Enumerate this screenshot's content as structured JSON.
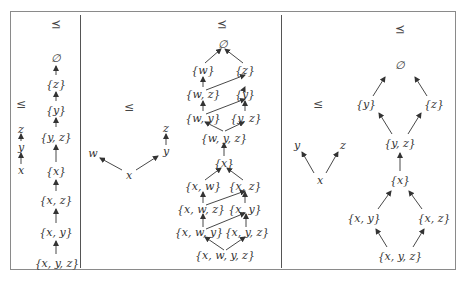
{
  "figure": {
    "panels": [
      {
        "id": "panel-1",
        "order_label": "≤",
        "preorder_label": "⪯",
        "poset_nodes": [
          "z",
          "y",
          "x"
        ],
        "hasse_nodes": [
          "∅",
          "{z}",
          "{y}",
          "{y, z}",
          "{x}",
          "{x, z}",
          "{x, y}",
          "{x, y, z}"
        ]
      },
      {
        "id": "panel-2",
        "order_label": "≤",
        "preorder_label": "⪯",
        "poset_nodes": [
          "w",
          "z",
          "y",
          "x"
        ],
        "hasse_nodes": [
          "∅",
          "{w}",
          "{z}",
          "{w, z}",
          "{y}",
          "{w, y}",
          "{y, z}",
          "{w, y, z}",
          "{x}",
          "{x, w}",
          "{x, z}",
          "{x, w, z}",
          "{x, y}",
          "{x, w, y}",
          "{x, y, z}",
          "{x, w, y, z}"
        ]
      },
      {
        "id": "panel-3",
        "order_label": "≤",
        "preorder_label": "⪯",
        "poset_nodes": [
          "y",
          "z",
          "x"
        ],
        "hasse_nodes": [
          "∅",
          "{y}",
          "{z}",
          "{y, z}",
          "{x}",
          "{x, y}",
          "{x, z}",
          "{x, y, z}"
        ]
      }
    ]
  }
}
